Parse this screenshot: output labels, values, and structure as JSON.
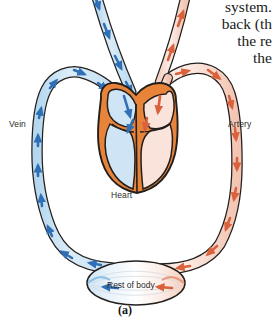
{
  "figure": {
    "caption": "(a)"
  },
  "body_text": {
    "lines": [
      "system.",
      "back (th",
      "the re",
      "the"
    ]
  },
  "labels": {
    "vein": "Vein",
    "artery": "Artery",
    "heart": "Heart",
    "rest_of_body": "Rest of body"
  },
  "colors": {
    "vein_fill": "#cfe4f4",
    "vein_stroke": "#2b2b2b",
    "vein_arrow": "#2f6fb5",
    "artery_fill": "#f8dcd2",
    "artery_stroke": "#2b2b2b",
    "artery_arrow": "#d9613c",
    "heart_muscle": "#e8833a",
    "heart_left_chamber": "#fae3db",
    "heart_right_chamber": "#cfe4f4",
    "outline": "#231f1c",
    "text": "#2b2b2b",
    "background": "#ffffff"
  },
  "parts": {
    "vein_vessel": "deoxygenated-blood-vessel",
    "artery_vessel": "oxygenated-blood-vessel",
    "heart_organ": "heart",
    "body_capillary_bed": "rest-of-body"
  }
}
